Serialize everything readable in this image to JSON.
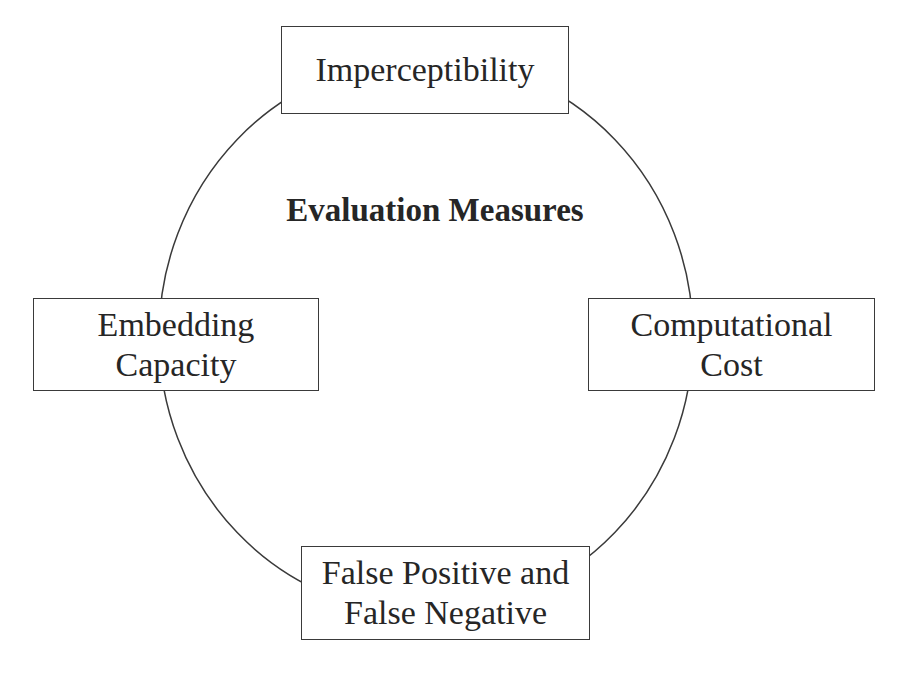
{
  "diagram": {
    "title": "Evaluation Measures",
    "line_color": "#3a3a3a",
    "text_color": "#262626",
    "nodes": [
      {
        "id": "top",
        "lines": [
          "Imperceptibility"
        ]
      },
      {
        "id": "left",
        "lines": [
          "Embedding",
          "Capacity"
        ]
      },
      {
        "id": "right",
        "lines": [
          "Computational",
          "Cost"
        ]
      },
      {
        "id": "bottom",
        "lines": [
          "False Positive and",
          "False Negative"
        ]
      }
    ],
    "connector": "ellipse"
  }
}
